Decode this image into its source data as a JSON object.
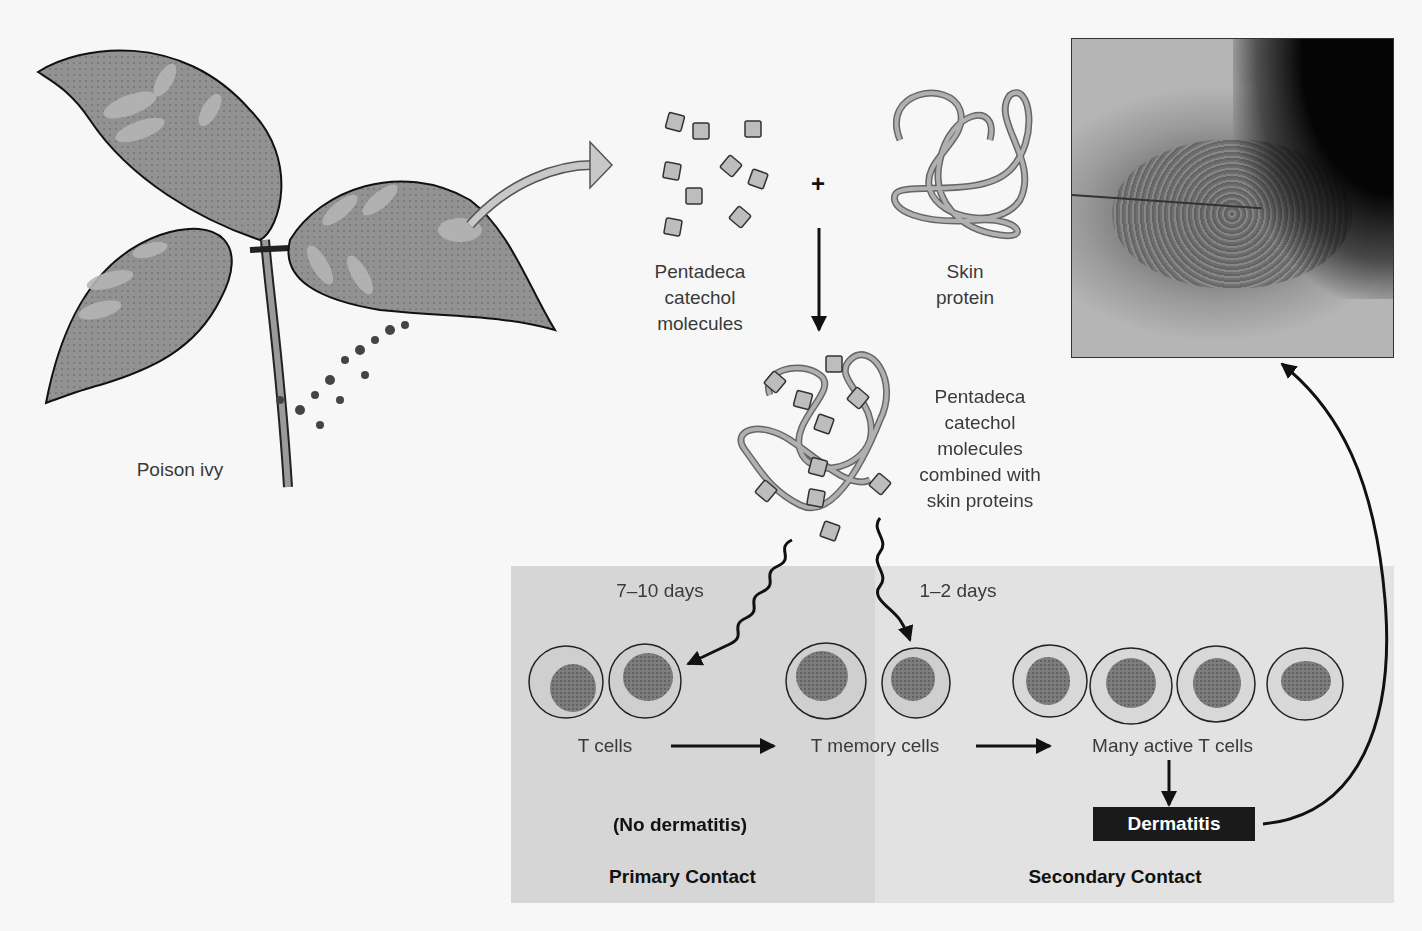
{
  "figure": {
    "plant": {
      "label": "Poison ivy"
    },
    "molecules": {
      "label_lines": [
        "Pentadeca",
        "catechol",
        "molecules"
      ]
    },
    "plus_sign": "+",
    "skin_protein": {
      "label_lines": [
        "Skin",
        "protein"
      ]
    },
    "combined": {
      "label_lines": [
        "Pentadeca",
        "catechol",
        "molecules",
        "combined with",
        "skin proteins"
      ]
    },
    "photo": {
      "description": "Photograph of dermatitis rash on skin"
    },
    "primary_contact": {
      "title": "Primary Contact",
      "time_label": "7–10 days",
      "cells_label": "T cells",
      "outcome": "(No dermatitis)"
    },
    "secondary_contact": {
      "title": "Secondary Contact",
      "time_label": "1–2 days",
      "memory_label": "T memory cells",
      "active_label": "Many active T cells",
      "outcome": "Dermatitis"
    },
    "colors": {
      "primary_panel": "#d6d6d6",
      "secondary_panel": "#e2e2e2",
      "leaf": "#8f8f8f",
      "molecule": "#bdbdbd",
      "protein_strand": "#a9a9a9",
      "dermatitis_box": "#1a1a1a"
    }
  }
}
